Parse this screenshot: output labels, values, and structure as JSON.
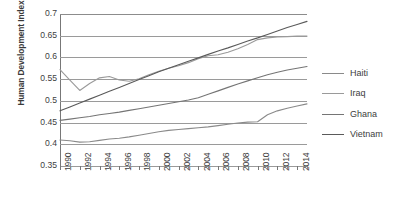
{
  "chart_data": {
    "type": "line",
    "title": "",
    "xlabel": "",
    "ylabel": "Human Development Index",
    "xlim": [
      1990,
      2015
    ],
    "ylim": [
      0.35,
      0.7
    ],
    "grid": true,
    "legend_position": "right",
    "y_ticks": [
      "0.7",
      "0.65",
      "0.6",
      "0.55",
      "0.5",
      "0.45",
      "0.4",
      "0.35"
    ],
    "y_tick_values": [
      0.7,
      0.65,
      0.6,
      0.55,
      0.5,
      0.45,
      0.4,
      0.35
    ],
    "x_ticks": [
      "1990",
      "1992",
      "1994",
      "1996",
      "1998",
      "2000",
      "2002",
      "2004",
      "2006",
      "2008",
      "2010",
      "2012",
      "2014"
    ],
    "x_tick_values": [
      1990,
      1992,
      1994,
      1996,
      1998,
      2000,
      2002,
      2004,
      2006,
      2008,
      2010,
      2012,
      2014
    ],
    "x": [
      1990,
      1991,
      1992,
      1993,
      1994,
      1995,
      1996,
      1997,
      1998,
      1999,
      2000,
      2001,
      2002,
      2003,
      2004,
      2005,
      2006,
      2007,
      2008,
      2009,
      2010,
      2011,
      2012,
      2013,
      2014,
      2015
    ],
    "series": [
      {
        "name": "Haiti",
        "color": "#8a8a8a",
        "values": [
          0.41,
          0.408,
          0.405,
          0.406,
          0.409,
          0.412,
          0.414,
          0.417,
          0.421,
          0.425,
          0.429,
          0.432,
          0.434,
          0.436,
          0.438,
          0.44,
          0.443,
          0.446,
          0.449,
          0.451,
          0.452,
          0.468,
          0.477,
          0.483,
          0.488,
          0.493
        ]
      },
      {
        "name": "Iraq",
        "color": "#9a9a9a",
        "values": [
          0.572,
          0.548,
          0.524,
          0.54,
          0.553,
          0.556,
          0.548,
          0.545,
          0.551,
          0.56,
          0.568,
          0.575,
          0.581,
          0.588,
          0.597,
          0.604,
          0.606,
          0.612,
          0.62,
          0.63,
          0.641,
          0.645,
          0.647,
          0.648,
          0.649,
          0.649
        ]
      },
      {
        "name": "Ghana",
        "color": "#757575",
        "values": [
          0.455,
          0.458,
          0.461,
          0.464,
          0.468,
          0.471,
          0.474,
          0.478,
          0.482,
          0.486,
          0.49,
          0.494,
          0.498,
          0.502,
          0.507,
          0.515,
          0.523,
          0.531,
          0.539,
          0.546,
          0.553,
          0.56,
          0.566,
          0.571,
          0.575,
          0.579
        ]
      },
      {
        "name": "Vietnam",
        "color": "#5a5a5a",
        "values": [
          0.477,
          0.486,
          0.495,
          0.504,
          0.513,
          0.522,
          0.531,
          0.54,
          0.549,
          0.558,
          0.567,
          0.575,
          0.583,
          0.591,
          0.599,
          0.607,
          0.615,
          0.622,
          0.63,
          0.638,
          0.645,
          0.653,
          0.661,
          0.669,
          0.676,
          0.683
        ]
      }
    ]
  },
  "legend": {
    "items": [
      {
        "label": "Haiti",
        "color": "#8a8a8a"
      },
      {
        "label": "Iraq",
        "color": "#9a9a9a"
      },
      {
        "label": "Ghana",
        "color": "#757575"
      },
      {
        "label": "Vietnam",
        "color": "#5a5a5a"
      }
    ]
  }
}
